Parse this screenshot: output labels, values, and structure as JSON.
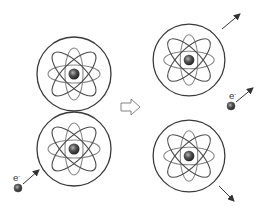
{
  "diagram": {
    "colors": {
      "stroke": "#3a3a3a",
      "orbit": "#4a4a4a",
      "nucleus_dark": "#2b2b2b",
      "nucleus_light": "#9a9a9a",
      "background": "#ffffff"
    },
    "atoms_before": [
      {
        "id": "atom-top-left",
        "cx": 74,
        "cy": 74,
        "r": 37
      },
      {
        "id": "atom-bottom-left",
        "cx": 74,
        "cy": 149,
        "r": 37
      }
    ],
    "atoms_after": [
      {
        "id": "atom-top-right",
        "cx": 189,
        "cy": 60,
        "r": 36,
        "motion": "up-right"
      },
      {
        "id": "atom-bottom-right",
        "cx": 189,
        "cy": 156,
        "r": 36,
        "motion": "down-right"
      }
    ],
    "electron_in": {
      "label": "e",
      "superscript": "-",
      "x": 18,
      "y": 188
    },
    "electron_out": {
      "label": "e",
      "superscript": "-",
      "x": 231,
      "y": 106
    },
    "transition_arrow": "hollow-right-arrow"
  }
}
